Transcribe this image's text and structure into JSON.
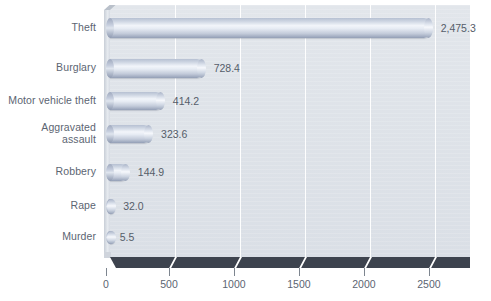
{
  "chart_data": {
    "type": "bar",
    "orientation": "horizontal",
    "title": "",
    "subtitle": "",
    "xlabel": "",
    "ylabel": "",
    "categories": [
      "Theft",
      "Burglary",
      "Motor vehicle theft",
      "Aggravated assault",
      "Robbery",
      "Rape",
      "Murder"
    ],
    "values": [
      2475.3,
      728.4,
      414.2,
      323.6,
      144.9,
      32.0,
      5.5
    ],
    "value_labels": [
      "2,475.3",
      "728.4",
      "414.2",
      "323.6",
      "144.9",
      "32.0",
      "5.5"
    ],
    "xlim": [
      0,
      2770
    ],
    "xticks": [
      0,
      500,
      1000,
      1500,
      2000,
      2500
    ],
    "xtick_labels": [
      "0",
      "500",
      "1000",
      "1500",
      "2000",
      "2500"
    ],
    "grid": "vertical-white",
    "legend": "none",
    "style": "3d-cylinder-bars",
    "colors": {
      "plot_background": "#dfe3e9",
      "gridline": "#ffffff",
      "floor": "#3d434e",
      "bar_light": "#f2f5fa",
      "bar_mid": "#c3cbda",
      "bar_dark": "#8e99b0",
      "text": "#5c6572"
    }
  },
  "category_label_lines": [
    [
      "Theft"
    ],
    [
      "Burglary"
    ],
    [
      "Motor vehicle theft"
    ],
    [
      "Aggravated",
      "assault"
    ],
    [
      "Robbery"
    ],
    [
      "Rape"
    ],
    [
      "Murder"
    ]
  ]
}
